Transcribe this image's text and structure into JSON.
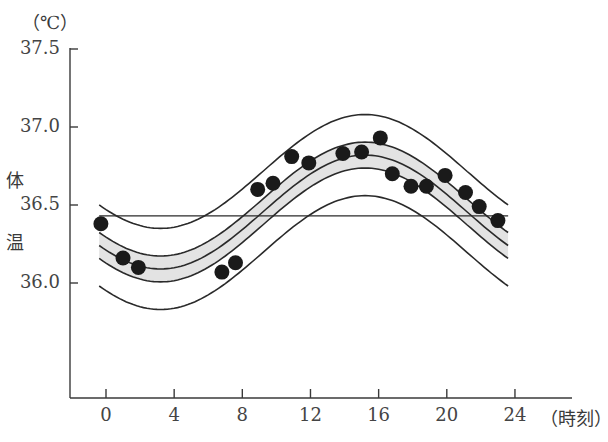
{
  "chart_data": {
    "type": "scatter",
    "title": "",
    "xlabel": "（時刻）",
    "ylabel": "体温",
    "yunit": "（℃）",
    "xlim": [
      -2,
      27
    ],
    "ylim": [
      35.3,
      37.5
    ],
    "xticks": [
      0,
      4,
      8,
      12,
      16,
      20,
      24
    ],
    "yticks": [
      36.0,
      36.5,
      37.0,
      37.5
    ],
    "ytick_labels": [
      "36.0",
      "36.5",
      "37.0",
      "37.5"
    ],
    "xtick_labels": [
      "0",
      "4",
      "8",
      "12",
      "16",
      "20",
      "24"
    ],
    "grid": false,
    "legend": null,
    "series": [
      {
        "name": "measured body temperature",
        "kind": "points",
        "points": [
          {
            "x": -0.3,
            "y": 36.38
          },
          {
            "x": 1.0,
            "y": 36.16
          },
          {
            "x": 1.9,
            "y": 36.1
          },
          {
            "x": 6.8,
            "y": 36.07
          },
          {
            "x": 7.6,
            "y": 36.13
          },
          {
            "x": 8.9,
            "y": 36.6
          },
          {
            "x": 9.8,
            "y": 36.64
          },
          {
            "x": 10.9,
            "y": 36.81
          },
          {
            "x": 11.9,
            "y": 36.77
          },
          {
            "x": 13.9,
            "y": 36.83
          },
          {
            "x": 15.0,
            "y": 36.84
          },
          {
            "x": 16.1,
            "y": 36.93
          },
          {
            "x": 16.8,
            "y": 36.7
          },
          {
            "x": 17.9,
            "y": 36.62
          },
          {
            "x": 18.8,
            "y": 36.62
          },
          {
            "x": 19.9,
            "y": 36.69
          },
          {
            "x": 21.1,
            "y": 36.58
          },
          {
            "x": 21.9,
            "y": 36.49
          },
          {
            "x": 23.0,
            "y": 36.4
          }
        ]
      },
      {
        "name": "fitted cosine curve",
        "kind": "cosinor",
        "mesor": 36.455,
        "amplitude": 0.365,
        "acrophase_hour": 15.2,
        "period_hours": 24,
        "x_range": [
          -0.4,
          23.6
        ]
      },
      {
        "name": "inner confidence band (shaded)",
        "kind": "band",
        "offset": 0.083
      },
      {
        "name": "outer bounds",
        "kind": "band-lines",
        "offset": 0.26
      },
      {
        "name": "mesor line",
        "kind": "hline",
        "y": 36.43,
        "x_range": [
          -0.4,
          23.6
        ]
      }
    ],
    "colors": {
      "points": "#1a1a1a",
      "lines": "#2a2a2a",
      "band_fill": "#e3e3e3",
      "axis": "#3a3a3a"
    }
  },
  "labels": {
    "yunit": "（℃）",
    "ylabel_top": "体",
    "ylabel_bottom": "温",
    "xlabel": "（時刻）"
  }
}
